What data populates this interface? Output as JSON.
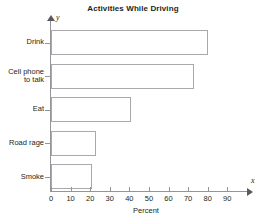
{
  "chart_data": {
    "type": "bar",
    "orientation": "horizontal",
    "title": "Activities While Driving",
    "xlabel": "Percent",
    "ylabel": "",
    "categories": [
      "Drink",
      "Cell phone to talk",
      "Eat",
      "Road rage",
      "Smoke"
    ],
    "category_lines": [
      [
        "Drink"
      ],
      [
        "Cell phone",
        "to talk"
      ],
      [
        "Eat"
      ],
      [
        "Road rage"
      ],
      [
        "Smoke"
      ]
    ],
    "values": [
      80,
      73,
      41,
      23,
      21
    ],
    "xlim": [
      0,
      97
    ],
    "xticks": [
      0,
      10,
      20,
      30,
      40,
      50,
      60,
      70,
      80,
      90
    ],
    "xtick_labels": [
      "0",
      "10",
      "20",
      "30",
      "40",
      "50",
      "60",
      "70",
      "80",
      "90"
    ],
    "grid": false,
    "legend": null,
    "axis_letters": {
      "x": "x",
      "y": "y"
    },
    "colors": {
      "bar_fill": "#ffffff",
      "bar_border": "#a7a9ac",
      "axis": "#939598",
      "text": "#231f20",
      "background": "#ffffff"
    }
  }
}
